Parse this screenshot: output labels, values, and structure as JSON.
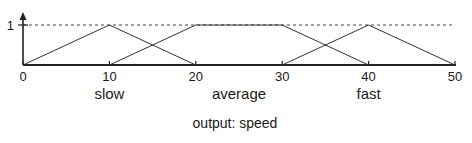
{
  "chart_data": {
    "type": "line",
    "title": "output: speed",
    "xlabel": "",
    "ylabel": "",
    "xlim": [
      0,
      50
    ],
    "ylim": [
      0,
      1
    ],
    "x_ticks": [
      0,
      10,
      20,
      30,
      40,
      50
    ],
    "x_tick_labels": [
      "0",
      "10",
      "20",
      "30",
      "40",
      "50"
    ],
    "y_ticks": [
      1
    ],
    "y_tick_labels": [
      "1"
    ],
    "reference_line": {
      "y": 1,
      "style": "dashed"
    },
    "grid": false,
    "legend": "none",
    "series": [
      {
        "name": "slow",
        "points": [
          [
            0,
            0
          ],
          [
            10,
            1
          ],
          [
            20,
            0
          ]
        ],
        "label_x": 10
      },
      {
        "name": "average",
        "points": [
          [
            10,
            0
          ],
          [
            20,
            1
          ],
          [
            30,
            1
          ],
          [
            40,
            0
          ]
        ],
        "label_x": 25
      },
      {
        "name": "fast",
        "points": [
          [
            30,
            0
          ],
          [
            40,
            1
          ],
          [
            50,
            0
          ]
        ],
        "label_x": 40
      }
    ]
  }
}
